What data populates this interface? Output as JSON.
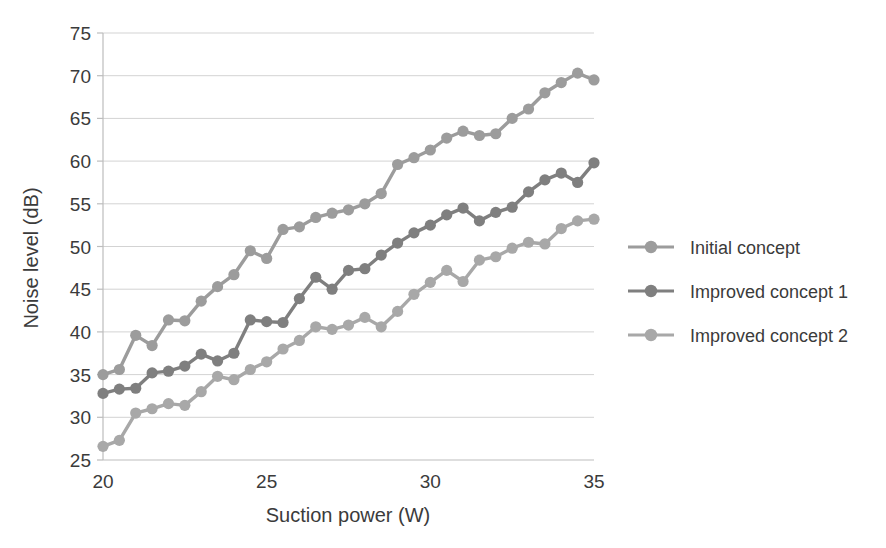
{
  "chart_data": {
    "type": "line",
    "title": "",
    "xlabel": "Suction power (W)",
    "ylabel": "Noise level (dB)",
    "xlim": [
      20,
      35
    ],
    "ylim": [
      25,
      75
    ],
    "xticks": [
      20,
      25,
      30,
      35
    ],
    "yticks": [
      25,
      30,
      35,
      40,
      45,
      50,
      55,
      60,
      65,
      70,
      75
    ],
    "grid": true,
    "legend_position": "right",
    "x": [
      20.0,
      20.5,
      21.0,
      21.5,
      22.0,
      22.5,
      23.0,
      23.5,
      24.0,
      24.5,
      25.0,
      25.5,
      26.0,
      26.5,
      27.0,
      27.5,
      28.0,
      28.5,
      29.0,
      29.5,
      30.0,
      30.5,
      31.0,
      31.5,
      32.0,
      32.5,
      33.0,
      33.5,
      34.0,
      34.5,
      35.0
    ],
    "series": [
      {
        "name": "Initial concept",
        "color": "#9c9c9c",
        "values": [
          35.0,
          35.6,
          39.6,
          38.4,
          41.4,
          41.3,
          43.6,
          45.3,
          46.7,
          49.5,
          48.6,
          52.0,
          52.3,
          53.4,
          53.9,
          54.3,
          55.0,
          56.2,
          59.6,
          60.4,
          61.3,
          62.7,
          63.5,
          63.0,
          63.2,
          65.0,
          66.1,
          68.0,
          69.2,
          70.3,
          69.5
        ]
      },
      {
        "name": "Improved concept 1",
        "color": "#7f7f7f",
        "values": [
          32.8,
          33.3,
          33.4,
          35.2,
          35.4,
          36.0,
          37.4,
          36.6,
          37.5,
          41.4,
          41.2,
          41.1,
          43.9,
          46.4,
          45.0,
          47.2,
          47.4,
          49.0,
          50.4,
          51.6,
          52.5,
          53.7,
          54.5,
          53.0,
          54.0,
          54.6,
          56.4,
          57.8,
          58.6,
          57.5,
          59.8
        ]
      },
      {
        "name": "Improved concept 2",
        "color": "#a8a8a8",
        "values": [
          26.6,
          27.3,
          30.5,
          31.0,
          31.6,
          31.4,
          33.0,
          34.8,
          34.4,
          35.6,
          36.5,
          38.0,
          39.0,
          40.6,
          40.3,
          40.8,
          41.7,
          40.6,
          42.4,
          44.4,
          45.8,
          47.2,
          45.9,
          48.4,
          48.8,
          49.8,
          50.5,
          50.3,
          52.1,
          53.0,
          53.2
        ]
      }
    ]
  },
  "legend": {
    "items": [
      {
        "label": "Initial concept"
      },
      {
        "label": "Improved concept 1"
      },
      {
        "label": "Improved concept 2"
      }
    ]
  },
  "axes": {
    "x_title": "Suction power (W)",
    "y_title": "Noise level (dB)"
  }
}
